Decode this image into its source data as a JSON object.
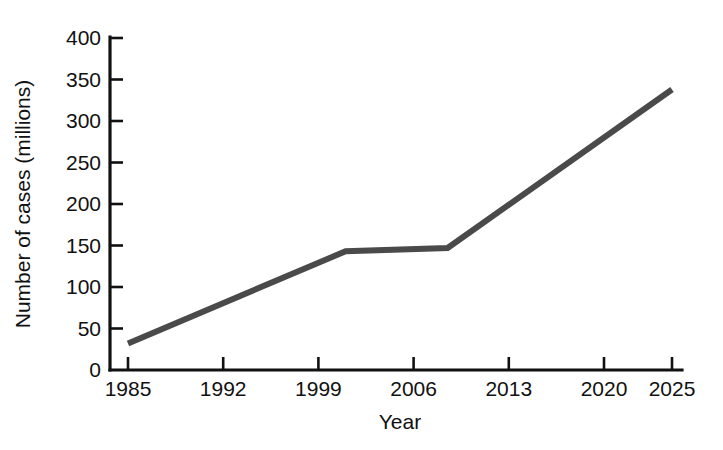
{
  "chart_data": {
    "type": "line",
    "title": "",
    "subtitle": "",
    "xlabel": "Year",
    "ylabel": "Number of cases (millions)",
    "x": [
      1985,
      2001,
      2008.5,
      2025
    ],
    "values": [
      32,
      143,
      147,
      338
    ],
    "series": [
      {
        "name": "Number of cases",
        "x": [
          1985,
          2001,
          2008.5,
          2025
        ],
        "values": [
          32,
          143,
          147,
          338
        ]
      }
    ],
    "xlim": [
      1985,
      2025
    ],
    "ylim": [
      0,
      400
    ],
    "xticks": [
      1985,
      1992,
      1999,
      2006,
      2013,
      2020,
      2025
    ],
    "xticklabels": [
      "1985",
      "1992",
      "1999",
      "2006",
      "2013",
      "2020",
      "2025"
    ],
    "yticks": [
      0,
      50,
      100,
      150,
      200,
      250,
      300,
      350,
      400
    ],
    "yticklabels": [
      "0",
      "50",
      "100",
      "150",
      "200",
      "250",
      "300",
      "350",
      "400"
    ],
    "grid": false,
    "legend": false,
    "legend_position": "none",
    "annotations": [],
    "colors": {
      "line": "#4a4a4a",
      "axis": "#111111",
      "text": "#111111",
      "background": "#ffffff"
    },
    "line_width": 6
  },
  "axes": {
    "y_title": "Number of cases (millions)",
    "x_title": "Year"
  }
}
